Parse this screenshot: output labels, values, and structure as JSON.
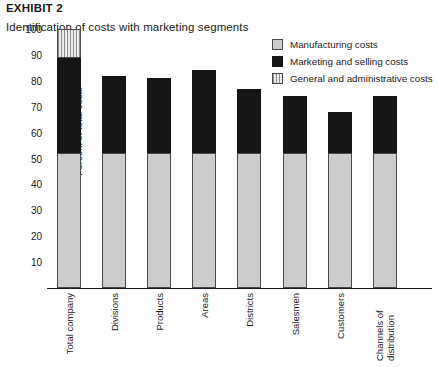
{
  "exhibit_label": "EXHIBIT 2",
  "title": "Identification of costs with marketing segments",
  "legend": {
    "position": "top-right",
    "items": [
      {
        "label": "Manufacturing costs",
        "swatch": "light-gray-solid",
        "color": "#cdcdcd"
      },
      {
        "label": "Marketing and selling costs",
        "swatch": "black-solid",
        "color": "#151515"
      },
      {
        "label": "General and administrative costs",
        "swatch": "vertical-hatch",
        "color": "#8d8d8d"
      }
    ]
  },
  "chart_data": {
    "type": "bar",
    "stacked": true,
    "title": "Identification of costs with marketing segments",
    "xlabel": "",
    "ylabel": "Percent of total costs",
    "ylim": [
      0,
      100
    ],
    "yticks": [
      10,
      20,
      30,
      40,
      50,
      60,
      70,
      80,
      90,
      100
    ],
    "ytick_labels": [
      "10",
      "20",
      "30",
      "40",
      "50",
      "60",
      "70",
      "80",
      "90",
      "100"
    ],
    "grid": false,
    "categories": [
      "Total company",
      "Divisions",
      "Products",
      "Areas",
      "Districts",
      "Salesmen",
      "Customers",
      "Channels of distribution"
    ],
    "series": [
      {
        "name": "Manufacturing costs",
        "color": "#cdcdcd",
        "values": [
          52,
          52,
          52,
          52,
          52,
          52,
          52,
          52
        ]
      },
      {
        "name": "Marketing and selling costs",
        "color": "#151515",
        "values": [
          37,
          30,
          29,
          32,
          25,
          22,
          16,
          22
        ]
      },
      {
        "name": "General and administrative costs",
        "color": "#8d8d8d",
        "values": [
          11,
          0,
          0,
          0,
          0,
          0,
          0,
          0
        ]
      }
    ],
    "totals": [
      100,
      82,
      81,
      84,
      77,
      74,
      68,
      74
    ]
  }
}
